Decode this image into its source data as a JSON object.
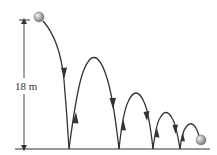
{
  "diagram": {
    "height_label": "18 m",
    "colors": {
      "line": "#333333",
      "ball_light": "#e6e6e6",
      "ball_dark": "#8a8a8a",
      "background": "#ffffff"
    },
    "ground": {
      "y": 149,
      "x_start": 15,
      "x_end": 210
    },
    "start_ball": {
      "cx": 39,
      "cy": 17,
      "r": 5
    },
    "end_ball": {
      "cx": 201,
      "cy": 140,
      "r": 5
    },
    "bounce_points_x": [
      69,
      119,
      153,
      180
    ],
    "arc_peaks": [
      {
        "x": 94,
        "y": 62
      },
      {
        "x": 136,
        "y": 92
      },
      {
        "x": 166,
        "y": 113
      }
    ]
  }
}
